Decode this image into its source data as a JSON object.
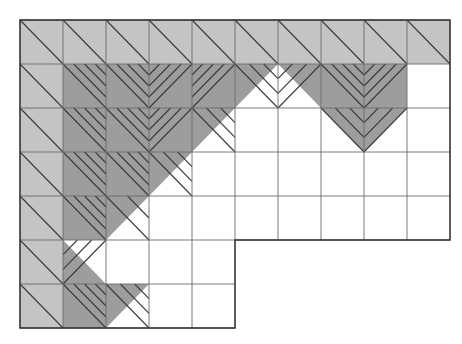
{
  "figure": {
    "type": "geometric-grid-diagram",
    "canvas": {
      "width": 462,
      "height": 344,
      "background": "#ffffff"
    },
    "grid": {
      "origin_x": 20,
      "origin_y": 20,
      "cell_width": 43,
      "cell_height": 44,
      "columns": 10,
      "rows": 7,
      "line_color": "#5a5a5a",
      "line_width": 0.9,
      "outline_color": "#3a3a3a",
      "outline_width": 1.4,
      "row_extent_columns": [
        10,
        10,
        10,
        10,
        10,
        5,
        5
      ]
    },
    "colors": {
      "light_fill": "#c4c4c4",
      "dark_fill": "#9d9d9d",
      "empty_fill": "#ffffff",
      "hatch_stroke": "#3c3c3c",
      "grid_stroke": "#6b6b6b",
      "outline_stroke": "#333333"
    },
    "legend": {
      "light_label": "light shaded cell",
      "dark_label": "dark shaded cell",
      "empty_label": "unshaded cell"
    },
    "cells": [
      {
        "c": 0,
        "r": 0,
        "fill": "light",
        "hatch": "nw-se",
        "lines": 1
      },
      {
        "c": 1,
        "r": 0,
        "fill": "light",
        "hatch": "nw-se",
        "lines": 1
      },
      {
        "c": 2,
        "r": 0,
        "fill": "light",
        "hatch": "nw-se",
        "lines": 1
      },
      {
        "c": 3,
        "r": 0,
        "fill": "light",
        "hatch": "nw-se",
        "lines": 1
      },
      {
        "c": 4,
        "r": 0,
        "fill": "light",
        "hatch": "nw-se",
        "lines": 1
      },
      {
        "c": 5,
        "r": 0,
        "fill": "light",
        "hatch": "nw-se",
        "lines": 1
      },
      {
        "c": 6,
        "r": 0,
        "fill": "light",
        "hatch": "nw-se",
        "lines": 1
      },
      {
        "c": 7,
        "r": 0,
        "fill": "light",
        "hatch": "nw-se",
        "lines": 1
      },
      {
        "c": 8,
        "r": 0,
        "fill": "light",
        "hatch": "nw-se",
        "lines": 1
      },
      {
        "c": 9,
        "r": 0,
        "fill": "light",
        "hatch": "nw-se",
        "lines": 1
      },
      {
        "c": 0,
        "r": 1,
        "fill": "light",
        "hatch": "nw-se",
        "lines": 1
      },
      {
        "c": 1,
        "r": 1,
        "fill": "dark",
        "hatch": "nw-se",
        "lines": 4
      },
      {
        "c": 2,
        "r": 1,
        "fill": "dark",
        "hatch": "nw-se",
        "lines": 4
      },
      {
        "c": 3,
        "r": 1,
        "fill": "dark",
        "hatch": "ne-sw",
        "lines": 4
      },
      {
        "c": 4,
        "r": 1,
        "fill": "dark",
        "hatch": "ne-sw",
        "lines": 4
      },
      {
        "c": 5,
        "r": 1,
        "fill": "dark-tri-ul",
        "hatch": "nw-se",
        "lines": 3
      },
      {
        "c": 6,
        "r": 1,
        "fill": "dark-tri-ur",
        "hatch": "ne-sw",
        "lines": 3
      },
      {
        "c": 7,
        "r": 1,
        "fill": "dark",
        "hatch": "nw-se",
        "lines": 4
      },
      {
        "c": 8,
        "r": 1,
        "fill": "dark",
        "hatch": "ne-sw",
        "lines": 4
      },
      {
        "c": 9,
        "r": 1,
        "fill": "empty",
        "hatch": "none",
        "lines": 0
      },
      {
        "c": 0,
        "r": 2,
        "fill": "light",
        "hatch": "nw-se",
        "lines": 1
      },
      {
        "c": 1,
        "r": 2,
        "fill": "dark",
        "hatch": "nw-se",
        "lines": 4
      },
      {
        "c": 2,
        "r": 2,
        "fill": "dark",
        "hatch": "nw-se",
        "lines": 4
      },
      {
        "c": 3,
        "r": 2,
        "fill": "dark",
        "hatch": "ne-sw",
        "lines": 4
      },
      {
        "c": 4,
        "r": 2,
        "fill": "dark-tri-ul",
        "hatch": "nw-se",
        "lines": 3
      },
      {
        "c": 5,
        "r": 2,
        "fill": "empty",
        "hatch": "none",
        "lines": 0
      },
      {
        "c": 6,
        "r": 2,
        "fill": "empty",
        "hatch": "none",
        "lines": 0
      },
      {
        "c": 7,
        "r": 2,
        "fill": "dark-tri-ur",
        "hatch": "nw-se",
        "lines": 3
      },
      {
        "c": 8,
        "r": 2,
        "fill": "dark-tri-ul2",
        "hatch": "ne-sw",
        "lines": 3
      },
      {
        "c": 9,
        "r": 2,
        "fill": "empty",
        "hatch": "none",
        "lines": 0
      },
      {
        "c": 0,
        "r": 3,
        "fill": "light",
        "hatch": "nw-se",
        "lines": 1
      },
      {
        "c": 1,
        "r": 3,
        "fill": "dark",
        "hatch": "nw-se",
        "lines": 4
      },
      {
        "c": 2,
        "r": 3,
        "fill": "dark",
        "hatch": "nw-se",
        "lines": 4
      },
      {
        "c": 3,
        "r": 3,
        "fill": "dark-tri-ul",
        "hatch": "nw-se",
        "lines": 3
      },
      {
        "c": 4,
        "r": 3,
        "fill": "empty",
        "hatch": "none",
        "lines": 0
      },
      {
        "c": 5,
        "r": 3,
        "fill": "empty",
        "hatch": "none",
        "lines": 0
      },
      {
        "c": 6,
        "r": 3,
        "fill": "empty",
        "hatch": "none",
        "lines": 0
      },
      {
        "c": 7,
        "r": 3,
        "fill": "empty",
        "hatch": "none",
        "lines": 0
      },
      {
        "c": 8,
        "r": 3,
        "fill": "empty",
        "hatch": "none",
        "lines": 0
      },
      {
        "c": 9,
        "r": 3,
        "fill": "empty",
        "hatch": "none",
        "lines": 0
      },
      {
        "c": 0,
        "r": 4,
        "fill": "light",
        "hatch": "nw-se",
        "lines": 1
      },
      {
        "c": 1,
        "r": 4,
        "fill": "dark",
        "hatch": "nw-se",
        "lines": 4
      },
      {
        "c": 2,
        "r": 4,
        "fill": "dark-tri-ul",
        "hatch": "nw-se",
        "lines": 2
      },
      {
        "c": 3,
        "r": 4,
        "fill": "empty",
        "hatch": "none",
        "lines": 0
      },
      {
        "c": 4,
        "r": 4,
        "fill": "empty",
        "hatch": "none",
        "lines": 0
      },
      {
        "c": 5,
        "r": 4,
        "fill": "empty",
        "hatch": "none",
        "lines": 0
      },
      {
        "c": 6,
        "r": 4,
        "fill": "empty",
        "hatch": "none",
        "lines": 0
      },
      {
        "c": 7,
        "r": 4,
        "fill": "empty",
        "hatch": "none",
        "lines": 0
      },
      {
        "c": 8,
        "r": 4,
        "fill": "empty",
        "hatch": "none",
        "lines": 0
      },
      {
        "c": 9,
        "r": 4,
        "fill": "empty",
        "hatch": "none",
        "lines": 0
      },
      {
        "c": 0,
        "r": 5,
        "fill": "light",
        "hatch": "nw-se",
        "lines": 1
      },
      {
        "c": 1,
        "r": 5,
        "fill": "dark-tri-ll",
        "hatch": "ne-sw",
        "lines": 3
      },
      {
        "c": 2,
        "r": 5,
        "fill": "empty",
        "hatch": "none",
        "lines": 0
      },
      {
        "c": 3,
        "r": 5,
        "fill": "empty",
        "hatch": "none",
        "lines": 0
      },
      {
        "c": 4,
        "r": 5,
        "fill": "empty",
        "hatch": "none",
        "lines": 0
      },
      {
        "c": 0,
        "r": 6,
        "fill": "light",
        "hatch": "nw-se",
        "lines": 1
      },
      {
        "c": 1,
        "r": 6,
        "fill": "dark",
        "hatch": "nw-se",
        "lines": 4
      },
      {
        "c": 2,
        "r": 6,
        "fill": "dark-tri-ul",
        "hatch": "nw-se",
        "lines": 3
      },
      {
        "c": 3,
        "r": 6,
        "fill": "empty",
        "hatch": "none",
        "lines": 0
      },
      {
        "c": 4,
        "r": 6,
        "fill": "empty",
        "hatch": "none",
        "lines": 0
      }
    ]
  }
}
